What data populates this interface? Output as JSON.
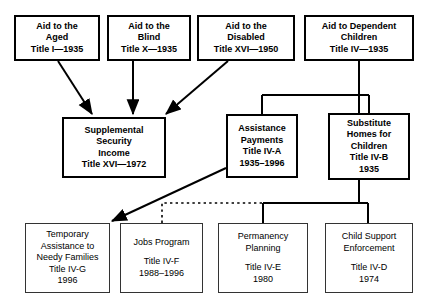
{
  "diagram": {
    "style": {
      "background": "#ffffff",
      "line_color": "#000000",
      "box_border_top": "#000000",
      "box_border_bottom": "#333333"
    },
    "nodes": [
      {
        "id": "aid-to-the-aged",
        "lines": [
          "Aid to the",
          "Aged",
          "Title I—1935"
        ],
        "weight": "bold"
      },
      {
        "id": "aid-to-the-blind",
        "lines": [
          "Aid to the",
          "Blind",
          "Title X—1935"
        ],
        "weight": "bold"
      },
      {
        "id": "aid-to-the-disabled",
        "lines": [
          "Aid to the",
          "Disabled",
          "Title XVI—1950"
        ],
        "weight": "bold"
      },
      {
        "id": "aid-to-dependent-children",
        "lines": [
          "Aid to Dependent",
          "Children",
          "Title IV—1935"
        ],
        "weight": "bold"
      },
      {
        "id": "supplemental-security-income",
        "lines": [
          "Supplemental",
          "Security",
          "Income",
          "Title XVI—1972"
        ],
        "weight": "bold"
      },
      {
        "id": "assistance-payments",
        "lines": [
          "Assistance",
          "Payments",
          "Title IV-A",
          "1935–1996"
        ],
        "weight": "bold"
      },
      {
        "id": "substitute-homes-for-children",
        "lines": [
          "Substitute",
          "Homes for",
          "Children",
          "Title IV-B",
          "1935"
        ],
        "weight": "bold"
      },
      {
        "id": "temporary-assistance-to-needy-families",
        "lines": [
          "Temporary",
          "Assistance to",
          "Needy Families",
          "Title IV-G",
          "1996"
        ],
        "weight": "normal"
      },
      {
        "id": "jobs-program",
        "lines": [
          "Jobs Program",
          "",
          "Title IV-F",
          "1988–1996"
        ],
        "weight": "normal"
      },
      {
        "id": "permanency-planning",
        "lines": [
          "Permanency",
          "Planning",
          "",
          "Title IV-E",
          "1980"
        ],
        "weight": "normal"
      },
      {
        "id": "child-support-enforcement",
        "lines": [
          "Child Support",
          "Enforcement",
          "",
          "Title IV-D",
          "1974"
        ],
        "weight": "normal"
      }
    ],
    "edges": [
      {
        "from": "aid-to-the-aged",
        "to": "supplemental-security-income",
        "style": "solid-arrow"
      },
      {
        "from": "aid-to-the-blind",
        "to": "supplemental-security-income",
        "style": "solid-arrow"
      },
      {
        "from": "aid-to-the-disabled",
        "to": "supplemental-security-income",
        "style": "solid-arrow"
      },
      {
        "from": "aid-to-dependent-children",
        "to": "assistance-payments",
        "style": "solid"
      },
      {
        "from": "aid-to-dependent-children",
        "to": "substitute-homes-for-children",
        "style": "solid"
      },
      {
        "from": "aid-to-dependent-children",
        "to": "permanency-planning",
        "style": "solid"
      },
      {
        "from": "aid-to-dependent-children",
        "to": "child-support-enforcement",
        "style": "solid"
      },
      {
        "from": "assistance-payments",
        "to": "temporary-assistance-to-needy-families",
        "style": "solid-arrow"
      },
      {
        "from": "jobs-program",
        "to": "aid-to-dependent-children",
        "style": "dotted"
      }
    ]
  }
}
